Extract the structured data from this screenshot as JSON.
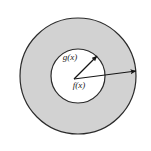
{
  "figure": {
    "background_color": "#ffffff",
    "canvas": {
      "width": 151,
      "height": 151
    },
    "outer_disk": {
      "name": "outer-circle",
      "center": {
        "x": 78,
        "y": 76
      },
      "radius": 58,
      "fill_color": "#d2d2d2",
      "stroke_color": "#2b2b2b",
      "stroke_width": 1.2
    },
    "inner_disk": {
      "name": "inner-circle",
      "center": {
        "x": 78,
        "y": 76
      },
      "radius": 27,
      "fill_color": "#ffffff",
      "stroke_color": "#2b2b2b",
      "stroke_width": 1.2
    },
    "arrows": [
      {
        "name": "inner-radius-arrow",
        "label": "g(x)",
        "from": {
          "x": 74,
          "y": 79
        },
        "to": {
          "x": 97,
          "y": 56
        },
        "color": "#151515",
        "stroke_width": 1.2
      },
      {
        "name": "outer-radius-arrow",
        "label": "f(x)",
        "from": {
          "x": 74,
          "y": 79
        },
        "to": {
          "x": 136,
          "y": 71
        },
        "color": "#151515",
        "stroke_width": 1.2
      }
    ],
    "labels": [
      {
        "name": "g-of-x-label",
        "text": "g(x)",
        "x": 70,
        "y": 60,
        "anchor": "middle",
        "color": "#1a1a1a"
      },
      {
        "name": "f-of-x-label",
        "text": "f(x)",
        "x": 79,
        "y": 88,
        "anchor": "middle",
        "color": "#1a1a1a"
      }
    ]
  }
}
